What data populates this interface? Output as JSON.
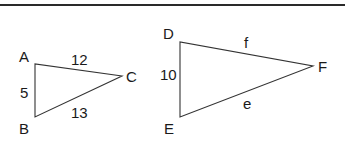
{
  "diagram": {
    "top_rule": {
      "color": "#2a2a2a"
    },
    "triangles": [
      {
        "name": "ABC",
        "vertices": [
          {
            "label": "A"
          },
          {
            "label": "B"
          },
          {
            "label": "C"
          }
        ],
        "sides": [
          {
            "between": "AC",
            "label": "12"
          },
          {
            "between": "AB",
            "label": "5"
          },
          {
            "between": "BC",
            "label": "13"
          }
        ]
      },
      {
        "name": "DEF",
        "vertices": [
          {
            "label": "D"
          },
          {
            "label": "E"
          },
          {
            "label": "F"
          }
        ],
        "sides": [
          {
            "between": "DF",
            "label": "f"
          },
          {
            "between": "DE",
            "label": "10"
          },
          {
            "between": "EF",
            "label": "e"
          }
        ]
      }
    ]
  }
}
